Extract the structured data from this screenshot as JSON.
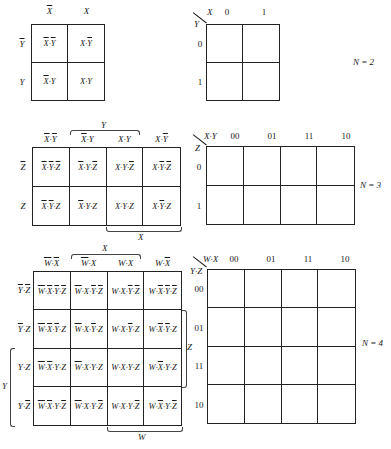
{
  "n2": {
    "n_label": "N = 2",
    "left": {
      "col_headers": [
        {
          "v": "X",
          "bar": true
        },
        {
          "v": "X",
          "bar": false
        }
      ],
      "row_headers": [
        {
          "v": "Y",
          "bar": true
        },
        {
          "v": "Y",
          "bar": false
        }
      ],
      "cells": [
        [
          [
            {
              "v": "X",
              "b": 1
            },
            {
              "v": "Y",
              "b": 1
            }
          ],
          [
            {
              "v": "X",
              "b": 0
            },
            {
              "v": "Y",
              "b": 1
            }
          ]
        ],
        [
          [
            {
              "v": "X",
              "b": 1
            },
            {
              "v": "Y",
              "b": 0
            }
          ],
          [
            {
              "v": "X",
              "b": 0
            },
            {
              "v": "Y",
              "b": 0
            }
          ]
        ]
      ]
    },
    "right": {
      "col_var": "X",
      "row_var": "Y",
      "col_codes": [
        "0",
        "1"
      ],
      "row_codes": [
        "0",
        "1"
      ]
    }
  },
  "n3": {
    "n_label": "N = 3",
    "left": {
      "col_headers": [
        [
          {
            "v": "X",
            "b": 1
          },
          {
            "v": "Y",
            "b": 1
          }
        ],
        [
          {
            "v": "X",
            "b": 1
          },
          {
            "v": "Y",
            "b": 0
          }
        ],
        [
          {
            "v": "X",
            "b": 0
          },
          {
            "v": "Y",
            "b": 0
          }
        ],
        [
          {
            "v": "X",
            "b": 0
          },
          {
            "v": "Y",
            "b": 1
          }
        ]
      ],
      "row_headers": [
        {
          "v": "Z",
          "bar": true
        },
        {
          "v": "Z",
          "bar": false
        }
      ],
      "top_brace_label": "Y",
      "bottom_brace_label": "X",
      "cells": [
        [
          [
            {
              "v": "X",
              "b": 1
            },
            {
              "v": "Y",
              "b": 1
            },
            {
              "v": "Z",
              "b": 1
            }
          ],
          [
            {
              "v": "X",
              "b": 1
            },
            {
              "v": "Y",
              "b": 0
            },
            {
              "v": "Z",
              "b": 1
            }
          ],
          [
            {
              "v": "X",
              "b": 0
            },
            {
              "v": "Y",
              "b": 0
            },
            {
              "v": "Z",
              "b": 1
            }
          ],
          [
            {
              "v": "X",
              "b": 0
            },
            {
              "v": "Y",
              "b": 1
            },
            {
              "v": "Z",
              "b": 1
            }
          ]
        ],
        [
          [
            {
              "v": "X",
              "b": 1
            },
            {
              "v": "Y",
              "b": 1
            },
            {
              "v": "Z",
              "b": 0
            }
          ],
          [
            {
              "v": "X",
              "b": 1
            },
            {
              "v": "Y",
              "b": 0
            },
            {
              "v": "Z",
              "b": 0
            }
          ],
          [
            {
              "v": "X",
              "b": 0
            },
            {
              "v": "Y",
              "b": 0
            },
            {
              "v": "Z",
              "b": 0
            }
          ],
          [
            {
              "v": "X",
              "b": 0
            },
            {
              "v": "Y",
              "b": 1
            },
            {
              "v": "Z",
              "b": 0
            }
          ]
        ]
      ]
    },
    "right": {
      "col_var": "X·Y",
      "row_var": "Z",
      "col_codes": [
        "00",
        "01",
        "11",
        "10"
      ],
      "row_codes": [
        "0",
        "1"
      ]
    }
  },
  "n4": {
    "n_label": "N = 4",
    "left": {
      "col_headers": [
        [
          {
            "v": "W",
            "b": 1
          },
          {
            "v": "X",
            "b": 1
          }
        ],
        [
          {
            "v": "W",
            "b": 1
          },
          {
            "v": "X",
            "b": 0
          }
        ],
        [
          {
            "v": "W",
            "b": 0
          },
          {
            "v": "X",
            "b": 0
          }
        ],
        [
          {
            "v": "W",
            "b": 0
          },
          {
            "v": "X",
            "b": 1
          }
        ]
      ],
      "row_headers": [
        [
          {
            "v": "Y",
            "b": 1
          },
          {
            "v": "Z",
            "b": 1
          }
        ],
        [
          {
            "v": "Y",
            "b": 1
          },
          {
            "v": "Z",
            "b": 0
          }
        ],
        [
          {
            "v": "Y",
            "b": 0
          },
          {
            "v": "Z",
            "b": 0
          }
        ],
        [
          {
            "v": "Y",
            "b": 0
          },
          {
            "v": "Z",
            "b": 1
          }
        ]
      ],
      "top_brace_label": "X",
      "bottom_brace_label": "W",
      "right_brace_label": "Z",
      "left_brace_label": "Y"
    },
    "right": {
      "col_var": "W·X",
      "row_var": "Y·Z",
      "col_codes": [
        "00",
        "01",
        "11",
        "10"
      ],
      "row_codes": [
        "00",
        "01",
        "11",
        "10"
      ]
    }
  }
}
